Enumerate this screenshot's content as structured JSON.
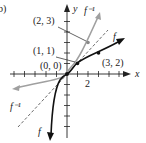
{
  "figure": {
    "part_label": "b)",
    "axes": {
      "x_label": "x",
      "y_label": "y",
      "x_tick_label": "2"
    },
    "curves": {
      "f_label": "f",
      "f_inverse_label": "f⁻¹",
      "identity_line": "y = x (dashed)"
    },
    "points": [
      {
        "label": "(2, 3)",
        "curve": "f inverse"
      },
      {
        "label": "(1, 1)",
        "curve": "intersection"
      },
      {
        "label": "(0, 0)",
        "curve": "intersection"
      },
      {
        "label": "(3, 2)",
        "curve": "f"
      }
    ],
    "colors": {
      "f": "#111111",
      "f_inverse": "#a0a0a0",
      "axes": "#222222",
      "dashed": "#444444"
    }
  }
}
